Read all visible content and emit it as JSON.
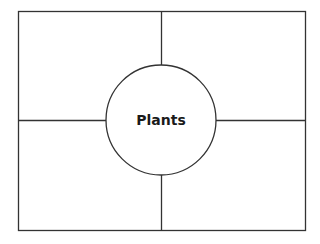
{
  "diagram": {
    "type": "four-square graphic organizer",
    "center_label": "Plants",
    "quadrants": [
      "",
      "",
      "",
      ""
    ],
    "colors": {
      "stroke": "#333333",
      "background": "#ffffff",
      "text": "#1a1a1a"
    }
  }
}
